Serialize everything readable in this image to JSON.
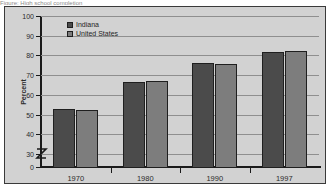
{
  "caption": {
    "text": "Figure: High school completion"
  },
  "chart_data": {
    "type": "bar",
    "title": "",
    "xlabel": "",
    "ylabel": "Percent",
    "categories": [
      "1970",
      "1980",
      "1990",
      "1997"
    ],
    "series": [
      {
        "name": "Indiana",
        "color": "#4b4b4b",
        "values": [
          53.0,
          66.5,
          76.0,
          82.0
        ]
      },
      {
        "name": "United States",
        "color": "#7d7d7d",
        "values": [
          52.5,
          67.0,
          75.5,
          82.5
        ]
      }
    ],
    "ylim": [
      30,
      100
    ],
    "yticks": [
      30,
      40,
      50,
      60,
      70,
      80,
      90,
      100
    ],
    "ytick_labels": [
      "30",
      "40",
      "50",
      "60",
      "70",
      "80",
      "90",
      "100"
    ],
    "baseline_label": "0",
    "axis_break": true,
    "grid": true,
    "legend_position": "upper left"
  },
  "legend": {
    "items": [
      {
        "label": "Indiana"
      },
      {
        "label": "United States"
      }
    ]
  }
}
